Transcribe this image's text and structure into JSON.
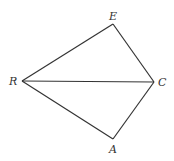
{
  "diagram": {
    "type": "geometry",
    "stroke_color": "#333333",
    "background": "#ffffff",
    "points": {
      "E": {
        "label": "E",
        "x": 113,
        "y": 24
      },
      "R": {
        "label": "R",
        "x": 22,
        "y": 81
      },
      "C": {
        "label": "C",
        "x": 154,
        "y": 82
      },
      "A": {
        "label": "A",
        "x": 113,
        "y": 139
      }
    },
    "segments": [
      [
        "R",
        "E"
      ],
      [
        "E",
        "C"
      ],
      [
        "R",
        "C"
      ],
      [
        "R",
        "A"
      ],
      [
        "A",
        "C"
      ]
    ]
  }
}
